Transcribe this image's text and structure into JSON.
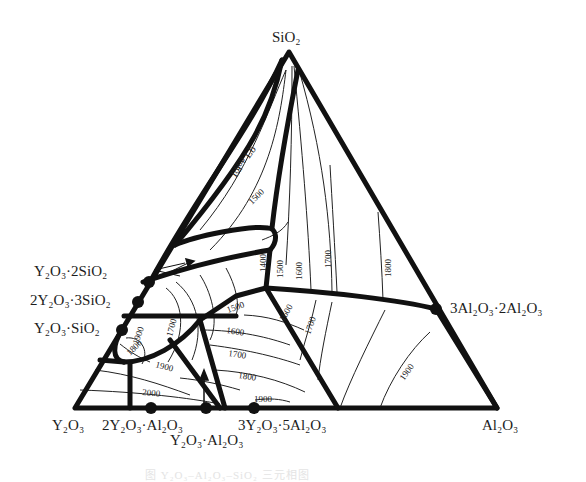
{
  "figure": {
    "type": "ternary-phase-diagram",
    "system": "Y2O3-Al2O3-SiO2",
    "colors": {
      "line": "#111111",
      "background": "#ffffff",
      "text": "#1c1c1c"
    }
  },
  "vertices": {
    "top": {
      "label": "SiO₂",
      "formula": "SiO2"
    },
    "left": {
      "label": "Y₂O₃",
      "formula": "Y2O3"
    },
    "right": {
      "label": "Al₂O₃",
      "formula": "Al2O3"
    }
  },
  "compounds": [
    {
      "id": "y2o3-2sio2",
      "label": "Y₂O₃·2SiO₂",
      "edge": "Y2O3-SiO2"
    },
    {
      "id": "2y2o3-3sio2",
      "label": "2Y₂O₃·3SiO₂",
      "edge": "Y2O3-SiO2"
    },
    {
      "id": "y2o3-sio2",
      "label": "Y₂O₃·SiO₂",
      "edge": "Y2O3-SiO2"
    },
    {
      "id": "3al2o3-2al2o3",
      "label": "3Al₂O₃·2Al₂O₃",
      "edge": "SiO2-Al2O3"
    },
    {
      "id": "2y2o3-al2o3",
      "label": "2Y₂O₃·Al₂O₃",
      "edge": "Y2O3-Al2O3"
    },
    {
      "id": "y2o3-al2o3",
      "label": "Y₂O₃·Al₂O₃",
      "edge": "Y2O3-Al2O3"
    },
    {
      "id": "3y2o3-5al2o3",
      "label": "3Y₂O₃·5Al₂O₃",
      "edge": "Y2O3-Al2O3"
    }
  ],
  "region_labels": {
    "immiscibility": "La + Lb"
  },
  "isotherms": {
    "unit": "°C",
    "values": [
      "1500",
      "1600",
      "1700",
      "1800",
      "1900",
      "2000"
    ],
    "labels": [
      {
        "text": "1600",
        "region": "silica-rich left"
      },
      {
        "text": "1500",
        "region": "silica-rich left"
      },
      {
        "text": "1400",
        "region": "central column"
      },
      {
        "text": "1500",
        "region": "central column"
      },
      {
        "text": "1600",
        "region": "central column"
      },
      {
        "text": "1700",
        "region": "mullite field"
      },
      {
        "text": "1800",
        "region": "mullite field"
      },
      {
        "text": "1900",
        "region": "Y2O3-SiO2 edge"
      },
      {
        "text": "1800",
        "region": "Y2O3-SiO2 edge"
      },
      {
        "text": "1700",
        "region": "yttrium silicate field"
      },
      {
        "text": "1500",
        "region": "center"
      },
      {
        "text": "1600",
        "region": "center"
      },
      {
        "text": "1700",
        "region": "center"
      },
      {
        "text": "1800",
        "region": "center"
      },
      {
        "text": "1900",
        "region": "YAG field"
      },
      {
        "text": "1600",
        "region": "right-center"
      },
      {
        "text": "1700",
        "region": "right-center"
      },
      {
        "text": "1900",
        "region": "corundum field"
      },
      {
        "text": "1900",
        "region": "Y2O3 field"
      },
      {
        "text": "2000",
        "region": "Y2O3 field"
      }
    ]
  },
  "caption": "图 Y₂O₃–Al₂O₃–SiO₂ 三元相图"
}
